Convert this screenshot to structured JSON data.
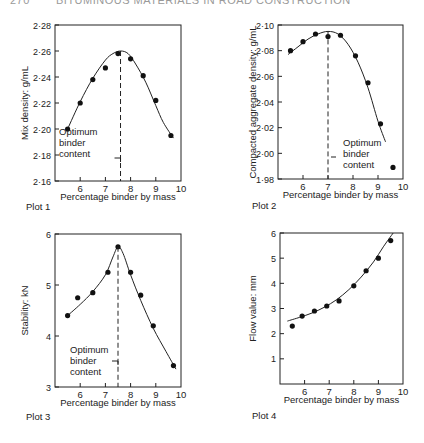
{
  "header": {
    "page_number": "270",
    "running_title": "BITUMINOUS MATERIALS IN ROAD CONSTRUCTION"
  },
  "annotation_label": [
    "Optimum",
    "binder",
    "content"
  ],
  "chart_data": [
    {
      "type": "scatter",
      "id": "plot1",
      "caption": "Plot 1",
      "title": "",
      "xlabel": "Percentage binder by mass",
      "ylabel": "Mix density: g/mL",
      "xlim": [
        5,
        10
      ],
      "ylim": [
        2.16,
        2.28
      ],
      "xticks": [
        6,
        7,
        8,
        9,
        10
      ],
      "xtick_labels": [
        "6",
        "7",
        "8",
        "9",
        "10"
      ],
      "yticks": [
        2.16,
        2.18,
        2.2,
        2.22,
        2.24,
        2.26,
        2.28
      ],
      "ytick_labels": [
        "2·16",
        "2·18",
        "2·20",
        "2·22",
        "2·24",
        "2·26",
        "2·28"
      ],
      "grid": false,
      "points": {
        "x": [
          5.5,
          6.0,
          6.5,
          7.0,
          7.5,
          8.0,
          8.5,
          9.0,
          9.6
        ],
        "y": [
          2.2,
          2.22,
          2.238,
          2.247,
          2.258,
          2.254,
          2.241,
          2.222,
          2.195
        ]
      },
      "fit_curve": {
        "x": [
          5.5,
          6.0,
          6.5,
          7.0,
          7.3,
          7.6,
          7.9,
          8.2,
          8.6,
          9.0,
          9.3,
          9.7
        ],
        "y": [
          2.2,
          2.221,
          2.239,
          2.253,
          2.258,
          2.26,
          2.258,
          2.25,
          2.236,
          2.218,
          2.205,
          2.193
        ]
      },
      "optimum_binder": 7.6,
      "annotation": "Optimum binder content"
    },
    {
      "type": "scatter",
      "id": "plot2",
      "caption": "Plot 2",
      "title": "",
      "xlabel": "Percentage binder by mass",
      "ylabel": "Compacted aggregate density: g/mL",
      "xlim": [
        5,
        10
      ],
      "ylim": [
        1.98,
        2.1
      ],
      "xticks": [
        6,
        7,
        8,
        9,
        10
      ],
      "xtick_labels": [
        "6",
        "7",
        "8",
        "9",
        "10"
      ],
      "yticks": [
        1.98,
        2.0,
        2.02,
        2.04,
        2.06,
        2.08,
        2.1
      ],
      "ytick_labels": [
        "1·98",
        "2·00",
        "2·02",
        "2·04",
        "2·06",
        "2·08",
        "2·10"
      ],
      "grid": false,
      "points": {
        "x": [
          5.5,
          6.0,
          6.5,
          7.0,
          7.5,
          8.1,
          8.6,
          9.1,
          9.6
        ],
        "y": [
          2.08,
          2.087,
          2.093,
          2.091,
          2.092,
          2.076,
          2.055,
          2.023,
          1.989
        ]
      },
      "fit_curve": {
        "x": [
          5.4,
          5.8,
          6.2,
          6.6,
          7.0,
          7.4,
          7.8,
          8.2,
          8.6,
          9.0,
          9.3
        ],
        "y": [
          2.077,
          2.083,
          2.089,
          2.093,
          2.095,
          2.093,
          2.085,
          2.071,
          2.051,
          2.025,
          2.009
        ]
      },
      "optimum_binder": 7.0,
      "annotation": "Optimum binder content"
    },
    {
      "type": "scatter",
      "id": "plot3",
      "caption": "Plot 3",
      "title": "",
      "xlabel": "Percentage binder by mass",
      "ylabel": "Stability: kN",
      "xlim": [
        5,
        10
      ],
      "ylim": [
        3,
        6
      ],
      "xticks": [
        6,
        7,
        8,
        9,
        10
      ],
      "xtick_labels": [
        "6",
        "7",
        "8",
        "9",
        "10"
      ],
      "yticks": [
        3,
        4,
        5,
        6
      ],
      "ytick_labels": [
        "3",
        "4",
        "5",
        "6"
      ],
      "grid": false,
      "points": {
        "x": [
          5.5,
          5.9,
          6.5,
          7.1,
          7.5,
          8.0,
          8.4,
          8.9,
          9.7
        ],
        "y": [
          4.4,
          4.75,
          4.85,
          5.25,
          5.75,
          5.25,
          4.8,
          4.2,
          3.42
        ]
      },
      "fit_curve": {
        "x": [
          5.5,
          6.0,
          6.5,
          7.0,
          7.3,
          7.5,
          7.7,
          8.0,
          8.4,
          8.9,
          9.4,
          9.8
        ],
        "y": [
          4.4,
          4.62,
          4.87,
          5.2,
          5.55,
          5.75,
          5.62,
          5.2,
          4.7,
          4.15,
          3.7,
          3.35
        ]
      },
      "optimum_binder": 7.5,
      "annotation": "Optimum binder content"
    },
    {
      "type": "scatter",
      "id": "plot4",
      "caption": "Plot 4",
      "title": "",
      "xlabel": "Percentage binder by mass",
      "ylabel": "Flow value: mm",
      "xlim": [
        5,
        10
      ],
      "ylim": [
        0,
        6
      ],
      "xticks": [
        6,
        7,
        8,
        9,
        10
      ],
      "xtick_labels": [
        "6",
        "7",
        "8",
        "9",
        "10"
      ],
      "yticks": [
        1,
        2,
        3,
        4,
        5,
        6
      ],
      "ytick_labels": [
        "1",
        "2",
        "3",
        "4",
        "5",
        "6"
      ],
      "grid": false,
      "points": {
        "x": [
          5.5,
          5.9,
          6.4,
          6.9,
          7.4,
          8.0,
          8.5,
          9.0,
          9.5
        ],
        "y": [
          2.3,
          2.7,
          2.9,
          3.1,
          3.3,
          3.9,
          4.5,
          5.0,
          5.7
        ]
      },
      "fit_curve": {
        "x": [
          5.3,
          5.8,
          6.3,
          6.8,
          7.3,
          7.8,
          8.3,
          8.8,
          9.2,
          9.6
        ],
        "y": [
          2.5,
          2.65,
          2.82,
          3.05,
          3.35,
          3.75,
          4.25,
          4.85,
          5.45,
          6.0
        ]
      },
      "optimum_binder": null,
      "annotation": ""
    }
  ]
}
